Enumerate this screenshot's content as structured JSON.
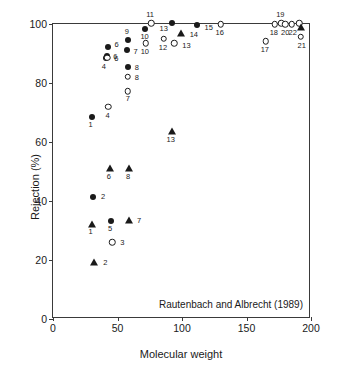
{
  "chart_data": {
    "type": "scatter",
    "title": "",
    "xlabel": "Molecular weight",
    "ylabel": "Rejection (%)",
    "xlim": [
      0,
      200
    ],
    "ylim": [
      0,
      100
    ],
    "xticks": [
      0,
      50,
      100,
      150,
      200
    ],
    "yticks": [
      0,
      20,
      40,
      60,
      80,
      100
    ],
    "xticklabels": [
      "0",
      "50",
      "100",
      "150",
      "200"
    ],
    "yticklabels": [
      "0",
      "20",
      "40",
      "60",
      "80",
      "100"
    ],
    "grid": false,
    "legend": null,
    "annotation": "Rautenbach and Albrecht (1989)",
    "series": [
      {
        "name": "filled-circle",
        "marker": "filled-circle",
        "points": [
          {
            "label": "1",
            "x": 30,
            "y": 68.5,
            "lx": -1,
            "ly": 8
          },
          {
            "label": "4",
            "x": 41,
            "y": 88.5,
            "lx": -2,
            "ly": 9
          },
          {
            "label": "6",
            "x": 43,
            "y": 92.3,
            "lx": 6,
            "ly": -2
          },
          {
            "label": "6",
            "x": 42,
            "y": 89.3,
            "lx": 6,
            "ly": 1
          },
          {
            "label": "9",
            "x": 58,
            "y": 94.5,
            "lx": -1,
            "ly": -8
          },
          {
            "label": "7",
            "x": 57,
            "y": 91.2,
            "lx": 7,
            "ly": 2
          },
          {
            "label": "8",
            "x": 58,
            "y": 85.3,
            "lx": 7,
            "ly": 1
          },
          {
            "label": "2",
            "x": 31,
            "y": 41.2,
            "lx": 8,
            "ly": 0
          },
          {
            "label": "5",
            "x": 45,
            "y": 33.2,
            "lx": -1,
            "ly": 8
          },
          {
            "label": "10",
            "x": 71,
            "y": 98.3,
            "lx": 0,
            "ly": 8
          },
          {
            "label": "13",
            "x": 92,
            "y": 100.3,
            "lx": -8,
            "ly": 6
          },
          {
            "label": "15",
            "x": 112,
            "y": 99.8,
            "lx": 7,
            "ly": 3
          }
        ]
      },
      {
        "name": "open-circle",
        "marker": "open-circle",
        "points": [
          {
            "label": "4",
            "x": 43,
            "y": 72.0,
            "lx": -1,
            "ly": 9
          },
          {
            "label": "6",
            "x": 42,
            "y": 88.6,
            "lx": 7,
            "ly": 1
          },
          {
            "label": "8",
            "x": 58,
            "y": 82.2,
            "lx": 7,
            "ly": 1
          },
          {
            "label": "7",
            "x": 58,
            "y": 77.2,
            "lx": 0,
            "ly": 8
          },
          {
            "label": "3",
            "x": 46,
            "y": 26.0,
            "lx": 8,
            "ly": 1
          },
          {
            "label": "11",
            "x": 76,
            "y": 100.2,
            "lx": -1,
            "ly": -8
          },
          {
            "label": "10",
            "x": 72,
            "y": 93.5,
            "lx": -1,
            "ly": 9
          },
          {
            "label": "12",
            "x": 86,
            "y": 95.0,
            "lx": -1,
            "ly": 9
          },
          {
            "label": "13",
            "x": 94,
            "y": 93.4,
            "lx": 8,
            "ly": 3
          },
          {
            "label": "16",
            "x": 130,
            "y": 99.9,
            "lx": -1,
            "ly": 9
          },
          {
            "label": "17",
            "x": 165,
            "y": 94.2,
            "lx": -1,
            "ly": 9
          },
          {
            "label": "18",
            "x": 172,
            "y": 99.9,
            "lx": -1,
            "ly": 9
          },
          {
            "label": "19",
            "x": 177,
            "y": 100.2,
            "lx": -1,
            "ly": -8
          },
          {
            "label": "20",
            "x": 180,
            "y": 99.9,
            "lx": 0,
            "ly": 9
          },
          {
            "label": "22",
            "x": 185,
            "y": 99.9,
            "lx": 1,
            "ly": 9
          },
          {
            "label": "21",
            "x": 192,
            "y": 95.6,
            "lx": 1,
            "ly": 9
          },
          {
            "label": "",
            "x": 191,
            "y": 100.3,
            "lx": 0,
            "ly": 0
          }
        ]
      },
      {
        "name": "filled-triangle",
        "marker": "filled-triangle",
        "points": [
          {
            "label": "1",
            "x": 30,
            "y": 32.2,
            "lx": -1,
            "ly": 8
          },
          {
            "label": "2",
            "x": 32,
            "y": 19.4,
            "lx": 9,
            "ly": 1
          },
          {
            "label": "6",
            "x": 44,
            "y": 51.3,
            "lx": -1,
            "ly": 9
          },
          {
            "label": "8",
            "x": 59,
            "y": 51.3,
            "lx": -1,
            "ly": 9
          },
          {
            "label": "7",
            "x": 59,
            "y": 33.7,
            "lx": 8,
            "ly": 1
          },
          {
            "label": "13",
            "x": 92,
            "y": 63.8,
            "lx": -1,
            "ly": 9
          },
          {
            "label": "14",
            "x": 99,
            "y": 96.8,
            "lx": 9,
            "ly": 2
          },
          {
            "label": "",
            "x": 192,
            "y": 98.9,
            "lx": 0,
            "ly": 0
          }
        ]
      }
    ]
  }
}
